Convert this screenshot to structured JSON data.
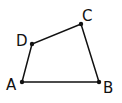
{
  "diagram": {
    "type": "quadrilateral",
    "stroke_color": "#111111",
    "background": "#ffffff",
    "vertices": [
      {
        "name": "A",
        "x": 22,
        "y": 82,
        "label_x": 6,
        "label_y": 90
      },
      {
        "name": "B",
        "x": 99,
        "y": 82,
        "label_x": 103,
        "label_y": 93
      },
      {
        "name": "C",
        "x": 81,
        "y": 24,
        "label_x": 82,
        "label_y": 21
      },
      {
        "name": "D",
        "x": 32,
        "y": 44,
        "label_x": 16,
        "label_y": 46
      }
    ],
    "edges": [
      [
        "A",
        "B"
      ],
      [
        "B",
        "C"
      ],
      [
        "C",
        "D"
      ],
      [
        "D",
        "A"
      ]
    ]
  }
}
